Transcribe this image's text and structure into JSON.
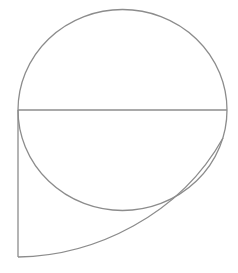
{
  "diagram": {
    "background": "#ffffff",
    "stroke_color": "#8c8c8c",
    "shapes": {
      "circle": {
        "cx": 122.5,
        "cy": 110,
        "rx": 104.5,
        "ry": 100.5
      },
      "diameter": {
        "x1": 18,
        "y1": 110,
        "x2": 227,
        "y2": 110
      },
      "vertical_edge": {
        "x1": 18,
        "y1": 110,
        "x2": 18,
        "y2": 257
      },
      "outer_arc": {
        "d": "M 18 257 C 95 256, 180 215, 223 138"
      }
    }
  }
}
